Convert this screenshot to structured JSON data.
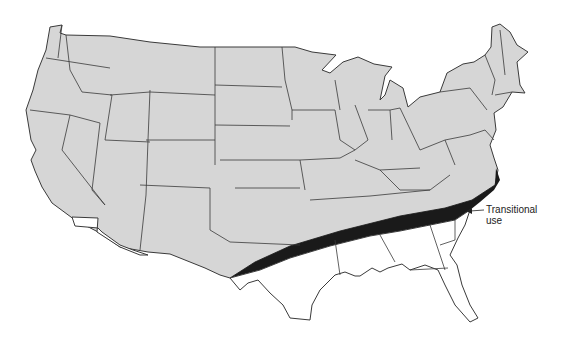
{
  "map": {
    "title": "",
    "subject": "United States map showing transitional use zone",
    "colors": {
      "north_fill": "#d6d6d6",
      "south_fill": "#ffffff",
      "transitional_fill": "#1a1a1a",
      "border": "#3a3a3a"
    },
    "regions": [
      {
        "name": "northern-zone",
        "fill": "light gray"
      },
      {
        "name": "transitional-zone",
        "fill": "black"
      },
      {
        "name": "southern-zone",
        "fill": "white"
      }
    ],
    "annotation": {
      "line1": "Transitional",
      "line2": "use"
    }
  }
}
